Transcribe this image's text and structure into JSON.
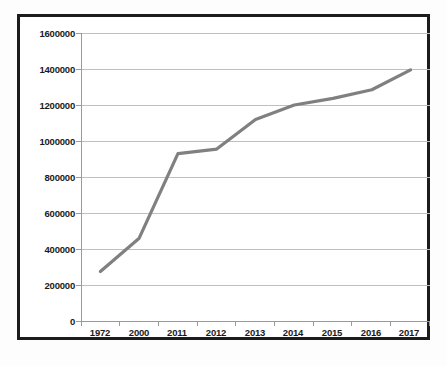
{
  "chart_data": {
    "type": "line",
    "title": "",
    "xlabel": "",
    "ylabel": "",
    "categories": [
      "1972",
      "2000",
      "2011",
      "2012",
      "2013",
      "2014",
      "2015",
      "2016",
      "2017"
    ],
    "values": [
      275000,
      460000,
      930000,
      955000,
      1120000,
      1200000,
      1237000,
      1285000,
      1395000
    ],
    "series": [
      {
        "name": "",
        "values": [
          275000,
          460000,
          930000,
          955000,
          1120000,
          1200000,
          1237000,
          1285000,
          1395000
        ]
      }
    ],
    "ylim": [
      0,
      1600000
    ],
    "ytick_values": [
      0,
      200000,
      400000,
      600000,
      800000,
      1000000,
      1200000,
      1400000,
      1600000
    ],
    "ytick_labels": [
      "0",
      "200000",
      "400000",
      "600000",
      "800000",
      "1000000",
      "1200000",
      "1400000",
      "1600000"
    ],
    "xtick_labels": [
      "1972",
      "2000",
      "2011",
      "2012",
      "2013",
      "2014",
      "2015",
      "2016",
      "2017"
    ],
    "grid": "horizontal",
    "legend": "none",
    "line_color": "#808080",
    "gridline_color": "#bfbfbf",
    "axis_color": "#9a9a9a",
    "border_color": "#1c1c1c",
    "plot_background": "#ffffff"
  },
  "title_remnant": "",
  "accessibility": {
    "chart_description": "Line chart of values rising from 275000 in 1972 to 1395000 in 2017"
  }
}
